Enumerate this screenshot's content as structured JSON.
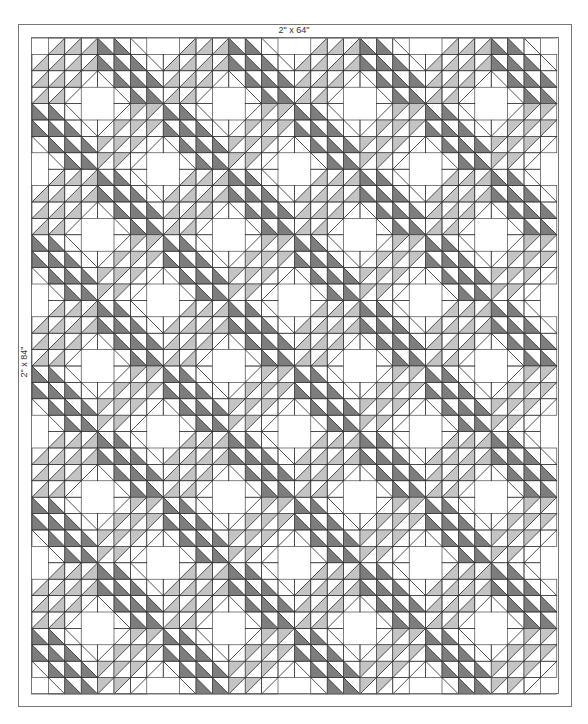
{
  "diagram": {
    "labels": {
      "top_border": "2\" x 64\"",
      "side_border": "2\" x 84\""
    },
    "colors": {
      "light": "#c4c4c4",
      "dark": "#7d7d7d",
      "line": "#2a2a2a",
      "border_line": "#777777",
      "background": "#ffffff"
    },
    "frame": {
      "outer": {
        "x": 18,
        "y": 24,
        "w": 553,
        "h": 682
      },
      "inner": {
        "x": 31,
        "y": 37,
        "w": 527,
        "h": 656
      }
    },
    "grid": {
      "x": 32,
      "y": 38,
      "cell": 16.4,
      "blocks_across": 4,
      "blocks_down": 5,
      "cells_per_block": 8
    },
    "cell_legend": {
      "0": "blank",
      "a": "/ diagonal, light bottom-right",
      "b": "/ diagonal, light top-left",
      "c": "\\ diagonal, dark bottom-left",
      "d": "\\ diagonal, dark top-right",
      "s": "/ diagonal line only",
      "t": "\\ diagonal line only"
    },
    "block_pattern": [
      [
        "0",
        "a",
        "a",
        "a",
        "c",
        "c",
        "t",
        "0"
      ],
      [
        "a",
        "a",
        "a",
        "a",
        "c",
        "c",
        "c",
        "t"
      ],
      [
        "a",
        "a",
        "a",
        "s",
        "t",
        "c",
        "c",
        "c"
      ],
      [
        "a",
        "a",
        "s",
        "0",
        "0",
        "t",
        "c",
        "c"
      ],
      [
        "c",
        "c",
        "t",
        "0",
        "0",
        "s",
        "b",
        "b"
      ],
      [
        "c",
        "c",
        "c",
        "t",
        "s",
        "b",
        "b",
        "b"
      ],
      [
        "t",
        "c",
        "c",
        "c",
        "b",
        "b",
        "b",
        "s"
      ],
      [
        "0",
        "t",
        "c",
        "c",
        "b",
        "b",
        "s",
        "0"
      ]
    ]
  }
}
